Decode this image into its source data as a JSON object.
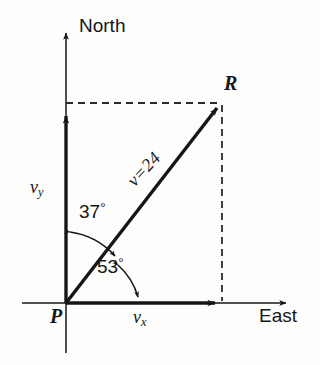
{
  "diagram": {
    "background_color": "#fdfdfc",
    "ink_color": "#161616",
    "axes": {
      "vertical_label": "North",
      "horizontal_label": "East",
      "origin_label": "P"
    },
    "vectors": {
      "resultant_point_label": "R",
      "resultant_magnitude_label": "v=24",
      "resultant_magnitude_value": 24,
      "x_component_label": "v",
      "x_component_subscript": "x",
      "y_component_label": "v",
      "y_component_subscript": "y"
    },
    "angles": {
      "from_north_value": "37",
      "from_north_unit": "°",
      "from_east_value": "53",
      "from_east_unit": "°"
    }
  }
}
